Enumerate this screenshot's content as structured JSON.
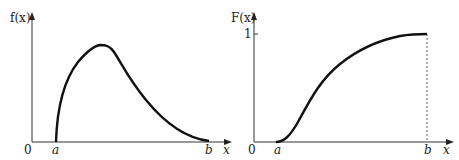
{
  "left_chart": {
    "y_label": "f(x)",
    "x_label": "x",
    "origin_label": "0",
    "a_label": "a",
    "b_label": "b",
    "curve_description": "probability density function rising steeply from a to a peak then decaying to zero at b"
  },
  "right_chart": {
    "y_label": "F(x)",
    "x_label": "x",
    "origin_label": "0",
    "a_label": "a",
    "b_label": "b",
    "y_tick_label": "1",
    "curve_description": "cumulative distribution function rising from 0 at a to 1 at b, with dashed vertical line at b"
  },
  "colors": {
    "curve": "#111111",
    "axis": "#333333",
    "dashed": "#666666"
  }
}
